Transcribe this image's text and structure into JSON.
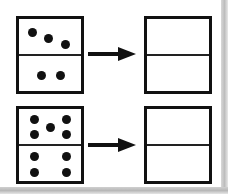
{
  "diagram": {
    "rows": [
      {
        "source_domino": {
          "top_pips": 3,
          "bottom_pips": 2
        },
        "arrow": "right-arrow",
        "target_domino": {
          "top_pips": null,
          "bottom_pips": null
        }
      },
      {
        "source_domino": {
          "top_pips": 5,
          "bottom_pips": 4
        },
        "arrow": "right-arrow",
        "target_domino": {
          "top_pips": null,
          "bottom_pips": null
        }
      }
    ],
    "colors": {
      "ink": "#111111",
      "background": "#ffffff",
      "page_edge": "#c0c0c0"
    }
  }
}
